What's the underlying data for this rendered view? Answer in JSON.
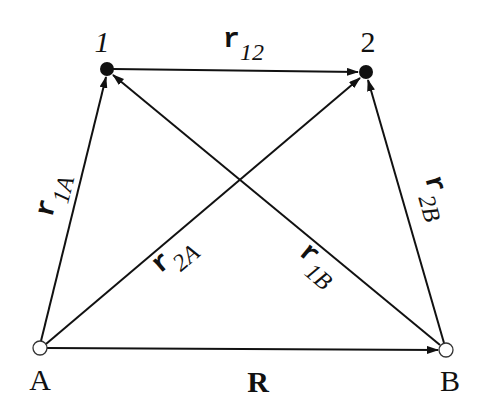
{
  "diagram": {
    "colors": {
      "line": "#111111",
      "background": "#ffffff",
      "open_node_fill": "#ffffff"
    },
    "nodes": [
      {
        "id": "1",
        "label": "1",
        "x": 107,
        "y": 69,
        "filled": true
      },
      {
        "id": "2",
        "label": "2",
        "x": 366,
        "y": 72,
        "filled": true
      },
      {
        "id": "A",
        "label": "A",
        "x": 40,
        "y": 348,
        "filled": false
      },
      {
        "id": "B",
        "label": "B",
        "x": 446,
        "y": 350,
        "filled": false
      }
    ],
    "labels": {
      "node_1": "1",
      "node_2": "2",
      "node_A": "A",
      "node_B": "B",
      "r12_main": "r",
      "r12_sub": "12",
      "r1A_main": "r",
      "r1A_sub": "1A",
      "r2A_main": "r",
      "r2A_sub": "2A",
      "r1B_main": "r",
      "r1B_sub": "1B",
      "r2B_main": "r",
      "r2B_sub": "2B",
      "R": "R"
    },
    "edges": [
      {
        "id": "r12",
        "from": "1",
        "to": "2",
        "label": "r12"
      },
      {
        "id": "r1A",
        "from": "A",
        "to": "1",
        "label": "r1A"
      },
      {
        "id": "r2A",
        "from": "A",
        "to": "2",
        "label": "r2A"
      },
      {
        "id": "r1B",
        "from": "B",
        "to": "1",
        "label": "r1B"
      },
      {
        "id": "r2B",
        "from": "B",
        "to": "2",
        "label": "r2B"
      },
      {
        "id": "R",
        "from": "A",
        "to": "B",
        "label": "R"
      }
    ]
  }
}
